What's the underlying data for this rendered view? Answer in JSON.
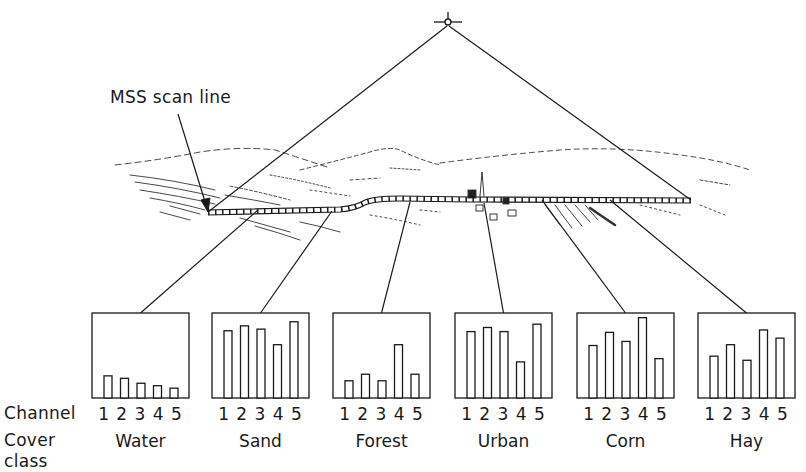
{
  "figure": {
    "annotation": "MSS scan line",
    "row_labels": {
      "channel": "Channel",
      "cover_class_line1": "Cover",
      "cover_class_line2": "class"
    },
    "channel_numbers": "1 2 3 4 5",
    "colors": {
      "ink": "#1a1a1a",
      "background": "#ffffff"
    }
  },
  "chart_data": {
    "type": "bar",
    "xlabel": "Channel",
    "ylabel": "Relative response",
    "categories": [
      "1",
      "2",
      "3",
      "4",
      "5"
    ],
    "ylim": [
      0,
      100
    ],
    "grid": false,
    "series": [
      {
        "name": "Water",
        "values": [
          27,
          24,
          18,
          15,
          12
        ]
      },
      {
        "name": "Sand",
        "values": [
          82,
          88,
          84,
          65,
          93
        ]
      },
      {
        "name": "Forest",
        "values": [
          21,
          29,
          21,
          65,
          29
        ]
      },
      {
        "name": "Urban",
        "values": [
          81,
          86,
          81,
          44,
          90
        ]
      },
      {
        "name": "Corn",
        "values": [
          64,
          80,
          69,
          98,
          48
        ]
      },
      {
        "name": "Hay",
        "values": [
          51,
          65,
          46,
          83,
          73
        ]
      }
    ]
  },
  "panels": [
    {
      "label": "Water",
      "x": 92,
      "anchor_x": 258,
      "anchor_y": 210
    },
    {
      "label": "Sand",
      "x": 212,
      "anchor_x": 332,
      "anchor_y": 211
    },
    {
      "label": "Forest",
      "x": 333,
      "anchor_x": 410,
      "anchor_y": 202
    },
    {
      "label": "Urban",
      "x": 455,
      "anchor_x": 484,
      "anchor_y": 203
    },
    {
      "label": "Corn",
      "x": 577,
      "anchor_x": 542,
      "anchor_y": 200
    },
    {
      "label": "Hay",
      "x": 698,
      "anchor_x": 610,
      "anchor_y": 200
    }
  ]
}
